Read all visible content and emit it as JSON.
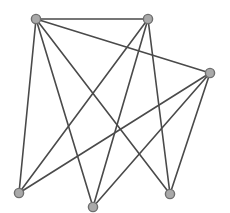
{
  "diagram": {
    "type": "graph",
    "directed": false,
    "width": 230,
    "height": 213,
    "style": {
      "background": "#ffffff",
      "edge_color": "#4a4a4a",
      "edge_width": 1.6,
      "node_fill": "#a9a9a9",
      "node_stroke": "#6e6e6e",
      "node_stroke_width": 1.4,
      "node_radius": 4.6
    },
    "nodes": [
      {
        "id": "n1",
        "x": 36,
        "y": 19
      },
      {
        "id": "n2",
        "x": 148,
        "y": 19
      },
      {
        "id": "n3",
        "x": 210,
        "y": 73
      },
      {
        "id": "n4",
        "x": 19,
        "y": 193
      },
      {
        "id": "n5",
        "x": 93,
        "y": 207
      },
      {
        "id": "n6",
        "x": 170,
        "y": 194
      }
    ],
    "edges": [
      {
        "source": "n1",
        "target": "n2"
      },
      {
        "source": "n1",
        "target": "n3"
      },
      {
        "source": "n1",
        "target": "n4"
      },
      {
        "source": "n1",
        "target": "n5"
      },
      {
        "source": "n1",
        "target": "n6"
      },
      {
        "source": "n2",
        "target": "n4"
      },
      {
        "source": "n2",
        "target": "n5"
      },
      {
        "source": "n2",
        "target": "n6"
      },
      {
        "source": "n3",
        "target": "n4"
      },
      {
        "source": "n3",
        "target": "n5"
      },
      {
        "source": "n3",
        "target": "n6"
      }
    ]
  }
}
